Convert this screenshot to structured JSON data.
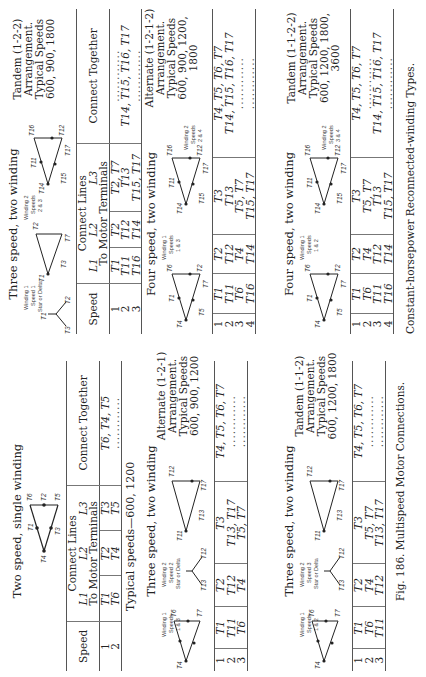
{
  "page": {
    "orientation": "rotated-90-ccw",
    "figure_caption": "Fig. 186.  Multispeed Motor Connections.",
    "figure_caption_cont": "Constant-horsepower Reconnected-winding Types.",
    "left_column": [
      {
        "title": "Two speed, single winding",
        "table": {
          "headers": {
            "speed": "Speed",
            "connect_lines": "Connect Lines",
            "to_motor": "To Motor Terminals",
            "l1": "L1",
            "l2": "L2",
            "l3": "L3",
            "together": "Connect Together"
          },
          "rows": [
            {
              "speed": "1",
              "l1": "T1",
              "l2": "T2",
              "l3": "T3",
              "together": "T6, T4, T5"
            },
            {
              "speed": "2",
              "l1": "T6",
              "l2": "T4",
              "l3": "T5",
              "together": "............"
            }
          ]
        },
        "note": "Typical speeds—600, 1200",
        "diagram": {
          "terminals": [
            "T1",
            "T2",
            "T3",
            "T4",
            "T5",
            "T6"
          ]
        }
      },
      {
        "title": "Three speed, two winding",
        "arrangement": [
          "Alternate (1-2-1)",
          "Arrangement.",
          "Typical Speeds",
          "600, 900, 1200"
        ],
        "diagram": {
          "winding1": [
            "Winding 1",
            "Speeds",
            "1 & 3"
          ],
          "winding2": [
            "Winding 2",
            "Speed 2",
            "Star or Delta"
          ]
        },
        "table": {
          "rows": [
            {
              "speed": "1",
              "l1": "T1",
              "l2": "T2",
              "l3": "T3",
              "together": "T4, T5, T6, T7"
            },
            {
              "speed": "2",
              "l1": "T11",
              "l2": "T12",
              "l3": "T13, T17",
              "together": "............"
            },
            {
              "speed": "3",
              "l1": "T6",
              "l2": "T4",
              "l3": "T5, T7",
              "together": "............"
            }
          ]
        }
      },
      {
        "title": "Three speed, two winding",
        "arrangement": [
          "Tandem (1-1-2)",
          "Arrangement.",
          "Typical Speeds",
          "600, 1200, 1800"
        ],
        "diagram": {
          "winding1": [
            "Winding 1",
            "Speeds",
            "1 & 2"
          ],
          "winding2": [
            "Winding 2",
            "Speed 3",
            "Star or Delta"
          ]
        },
        "table": {
          "rows": [
            {
              "speed": "1",
              "l1": "T1",
              "l2": "T2",
              "l3": "T3",
              "together": "T4, T5, T6, T7"
            },
            {
              "speed": "2",
              "l1": "T6",
              "l2": "T4",
              "l3": "T5, T7",
              "together": "............"
            },
            {
              "speed": "3",
              "l1": "T11",
              "l2": "T12",
              "l3": "T13, T17",
              "together": "............"
            }
          ]
        }
      }
    ],
    "right_column": [
      {
        "title": "Three speed, two winding",
        "arrangement": [
          "Tandem (1-2-2)",
          "Arrangement.",
          "Typical Speeds",
          "600, 900, 1800"
        ],
        "diagram": {
          "winding1": [
            "Winding 1",
            "Speed 1",
            "Star or Delta"
          ],
          "winding2": [
            "Winding 2",
            "Speeds",
            "2 & 3"
          ]
        },
        "table": {
          "headers": {
            "speed": "Speed",
            "connect_lines": "Connect Lines",
            "to_motor": "To Motor Terminals",
            "l1": "L1",
            "l2": "L2",
            "l3": "L3",
            "together": "Connect Together"
          },
          "rows": [
            {
              "speed": "1",
              "l1": "T1",
              "l2": "T2",
              "l3": "T2, T7",
              "together": "............"
            },
            {
              "speed": "2",
              "l1": "T11",
              "l2": "T12",
              "l3": "T13",
              "together": "T14, T15, T16, T17"
            },
            {
              "speed": "3",
              "l1": "T16",
              "l2": "T14",
              "l3": "T15, T17",
              "together": "............"
            }
          ]
        }
      },
      {
        "title": "Four speed, two winding",
        "arrangement": [
          "Alternate (1-2-1-2)",
          "Arrangement.",
          "Typical Speeds",
          "600, 900, 1200, 1800"
        ],
        "diagram": {
          "winding1": [
            "Winding 1",
            "Speeds",
            "1 & 3"
          ],
          "winding2": [
            "Winding 2",
            "Speeds",
            "2 & 4"
          ]
        },
        "table": {
          "rows": [
            {
              "speed": "1",
              "l1": "T1",
              "l2": "T2",
              "l3": "T3",
              "together": "T4, T5, T6, T7"
            },
            {
              "speed": "2",
              "l1": "T11",
              "l2": "T12",
              "l3": "T13",
              "together": "T14, T15, T16, T17"
            },
            {
              "speed": "3",
              "l1": "T6",
              "l2": "T4",
              "l3": "T5, T7",
              "together": "............"
            },
            {
              "speed": "4",
              "l1": "T16",
              "l2": "T14",
              "l3": "T15, T17",
              "together": "............"
            }
          ]
        }
      },
      {
        "title": "Four speed, two winding",
        "arrangement": [
          "Tandem (1-1-2-2)",
          "Arrangement.",
          "Typical Speeds",
          "600, 1200, 1800, 3600"
        ],
        "diagram": {
          "winding1": [
            "Winding 1",
            "Speeds",
            "1 & 2"
          ],
          "winding2": [
            "Winding 2",
            "Speeds",
            "3 & 4"
          ]
        },
        "table": {
          "rows": [
            {
              "speed": "1",
              "l1": "T1",
              "l2": "T2",
              "l3": "T3",
              "together": "T4, T5, T6, T7"
            },
            {
              "speed": "2",
              "l1": "T6",
              "l2": "T4",
              "l3": "T5, T7",
              "together": "............"
            },
            {
              "speed": "3",
              "l1": "T11",
              "l2": "T12",
              "l3": "T13",
              "together": "T14, T15, T16, T17"
            },
            {
              "speed": "4",
              "l1": "T16",
              "l2": "T14",
              "l3": "T15, T17",
              "together": "............"
            }
          ]
        }
      }
    ]
  }
}
